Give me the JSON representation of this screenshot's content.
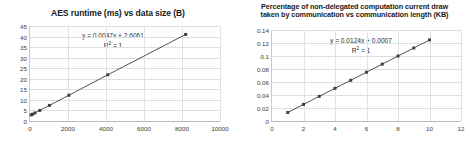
{
  "document": {
    "background_color": "#ffffff",
    "figure_count": 2
  },
  "chart_data": [
    {
      "id": "aes-runtime",
      "type": "scatter",
      "title": "AES runtime (ms) vs data size (B)",
      "title_lines": [
        "AES runtime (ms) vs data size (B)"
      ],
      "xlabel": "",
      "ylabel": "",
      "xlim": [
        0,
        10000
      ],
      "ylim": [
        0,
        45
      ],
      "xticks": [
        0,
        2000,
        4000,
        6000,
        8000,
        10000
      ],
      "yticks": [
        0,
        5,
        10,
        15,
        20,
        25,
        30,
        35,
        40,
        45
      ],
      "grid": "horizontal-and-vertical",
      "legend": "none",
      "marker_color": "#404040",
      "line_color": "#3f3f3f",
      "x": [
        64,
        128,
        256,
        512,
        1024,
        2048,
        4096,
        8192
      ],
      "y": [
        2.9,
        3.2,
        3.8,
        5.0,
        7.4,
        12.2,
        21.9,
        41.0
      ],
      "annotations": {
        "equation": "y = 0.0047x + 2.6061",
        "r_squared_label": "R",
        "r_squared_exp": "2",
        "r_squared_value": "= 1",
        "r_squared_full": "R² = 1"
      }
    },
    {
      "id": "comm-current-draw",
      "type": "scatter",
      "title": "Percentage of non-delegated computation current draw taken by communication vs communication length (KB)",
      "title_lines": [
        "Percentage of non-delegated computation current draw",
        "taken by communication vs communication length (KB)"
      ],
      "xlabel": "",
      "ylabel": "",
      "xlim": [
        0,
        12
      ],
      "ylim": [
        0,
        0.14
      ],
      "xticks": [
        0,
        2,
        4,
        6,
        8,
        10,
        12
      ],
      "yticks": [
        "0",
        "0.02",
        "0.04",
        "0.06",
        "0.08",
        "0.1",
        "0.12",
        "0.14"
      ],
      "ytick_values": [
        0,
        0.02,
        0.04,
        0.06,
        0.08,
        0.1,
        0.12,
        0.14
      ],
      "grid": "horizontal-and-vertical",
      "legend": "none",
      "marker_color": "#404040",
      "line_color": "#3f3f3f",
      "x": [
        1,
        2,
        3,
        4,
        5,
        6,
        7,
        8,
        9,
        10
      ],
      "y": [
        0.0131,
        0.0255,
        0.0379,
        0.0503,
        0.0627,
        0.0751,
        0.0875,
        0.0999,
        0.1123,
        0.1247
      ],
      "annotations": {
        "equation": "y = 0.0124x + 0.0007",
        "r_squared_label": "R",
        "r_squared_exp": "2",
        "r_squared_value": "= 1",
        "r_squared_full": "R² = 1"
      }
    }
  ]
}
